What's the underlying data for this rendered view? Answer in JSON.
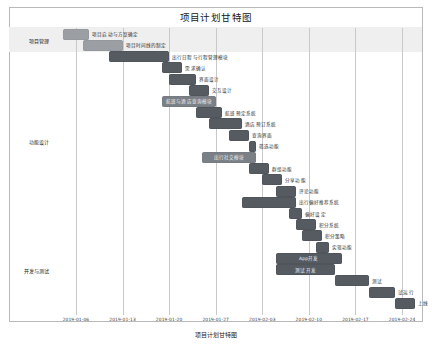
{
  "chart_data": {
    "type": "bar",
    "subtype": "gantt",
    "title": "项目计划甘特图",
    "xlabel": "",
    "ylabel": "",
    "axis_caption": "项目计划甘特图",
    "grid": true,
    "legend": "none",
    "xlim": [
      "2019-01-03",
      "2019-02-27"
    ],
    "x_ticks": [
      "2019-01-06",
      "2019-01-13",
      "2019-01-20",
      "2019-01-27",
      "2019-02-03",
      "2019-02-10",
      "2019-02-17",
      "2019-02-24"
    ],
    "categories": [
      "项目管理",
      "功能设计",
      "开发与测试"
    ],
    "tasks": [
      {
        "name": "项目启动与方案确定",
        "start": "2019-01-04",
        "end": "2019-01-08",
        "category": "项目管理",
        "label_inside": false,
        "shade": "light"
      },
      {
        "name": "项目时间线的制定",
        "start": "2019-01-07",
        "end": "2019-01-13",
        "category": "项目管理",
        "label_inside": false,
        "shade": "light"
      },
      {
        "name": "出行日程与行程管理模块",
        "start": "2019-01-11",
        "end": "2019-01-20",
        "category": "功能设计",
        "label_inside": false,
        "shade": "dark"
      },
      {
        "name": "需求确认",
        "start": "2019-01-19",
        "end": "2019-01-22",
        "category": "功能设计",
        "label_inside": false,
        "shade": "dark"
      },
      {
        "name": "界面设计",
        "start": "2019-01-20",
        "end": "2019-01-24",
        "category": "功能设计",
        "label_inside": false,
        "shade": "dark"
      },
      {
        "name": "交互设计",
        "start": "2019-01-23",
        "end": "2019-01-26",
        "category": "功能设计",
        "label_inside": false,
        "shade": "dark"
      },
      {
        "name": "航班与酒店查询模块",
        "start": "2019-01-19",
        "end": "2019-01-27",
        "category": "功能设计",
        "label_inside": true,
        "shade": "mid"
      },
      {
        "name": "航班预定系统",
        "start": "2019-01-24",
        "end": "2019-01-28",
        "category": "功能设计",
        "label_inside": false,
        "shade": "dark"
      },
      {
        "name": "酒店预订系统",
        "start": "2019-01-26",
        "end": "2019-01-31",
        "category": "功能设计",
        "label_inside": false,
        "shade": "dark"
      },
      {
        "name": "查询界面",
        "start": "2019-01-29",
        "end": "2019-02-01",
        "category": "功能设计",
        "label_inside": false,
        "shade": "dark"
      },
      {
        "name": "筛选功能",
        "start": "2019-02-01",
        "end": "2019-02-02",
        "category": "功能设计",
        "label_inside": false,
        "shade": "dark"
      },
      {
        "name": "出行社交模块",
        "start": "2019-01-25",
        "end": "2019-02-02",
        "category": "功能设计",
        "label_inside": true,
        "shade": "mid"
      },
      {
        "name": "群组功能",
        "start": "2019-02-01",
        "end": "2019-02-04",
        "category": "功能设计",
        "label_inside": false,
        "shade": "dark"
      },
      {
        "name": "分享功能",
        "start": "2019-02-03",
        "end": "2019-02-06",
        "category": "功能设计",
        "label_inside": false,
        "shade": "dark"
      },
      {
        "name": "评论功能",
        "start": "2019-02-05",
        "end": "2019-02-08",
        "category": "功能设计",
        "label_inside": false,
        "shade": "dark"
      },
      {
        "name": "出行偏好推荐系统",
        "start": "2019-01-31",
        "end": "2019-02-08",
        "category": "功能设计",
        "label_inside": false,
        "shade": "dark"
      },
      {
        "name": "偏好设定",
        "start": "2019-02-07",
        "end": "2019-02-09",
        "category": "功能设计",
        "label_inside": false,
        "shade": "dark"
      },
      {
        "name": "积分系统",
        "start": "2019-02-08",
        "end": "2019-02-11",
        "category": "功能设计",
        "label_inside": false,
        "shade": "dark"
      },
      {
        "name": "积分策略",
        "start": "2019-02-09",
        "end": "2019-02-12",
        "category": "开发与测试",
        "label_inside": false,
        "shade": "dark"
      },
      {
        "name": "实现功能",
        "start": "2019-02-11",
        "end": "2019-02-13",
        "category": "开发与测试",
        "label_inside": false,
        "shade": "dark"
      },
      {
        "name": "App开发",
        "start": "2019-02-05",
        "end": "2019-02-15",
        "category": "开发与测试",
        "label_inside": true,
        "shade": "dark"
      },
      {
        "name": "测试开发",
        "start": "2019-02-05",
        "end": "2019-02-14",
        "category": "开发与测试",
        "label_inside": true,
        "shade": "dark"
      },
      {
        "name": "测试",
        "start": "2019-02-14",
        "end": "2019-02-19",
        "category": "开发与测试",
        "label_inside": false,
        "shade": "dark"
      },
      {
        "name": "试运行",
        "start": "2019-02-19",
        "end": "2019-02-23",
        "category": "开发与测试",
        "label_inside": false,
        "shade": "dark"
      },
      {
        "name": "上线",
        "start": "2019-02-23",
        "end": "2019-02-26",
        "category": "开发与测试",
        "label_inside": false,
        "shade": "dark"
      }
    ],
    "bands": [
      {
        "category": "项目管理",
        "shaded": true
      },
      {
        "category": "功能设计",
        "shaded": false
      },
      {
        "category": "开发与测试",
        "shaded": false
      }
    ]
  }
}
